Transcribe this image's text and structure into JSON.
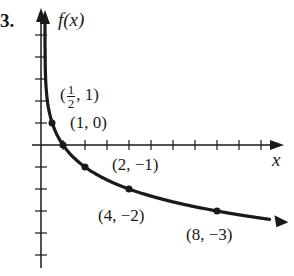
{
  "problem_number": "3.",
  "chart_data": {
    "type": "line",
    "title": "",
    "function": "f(x) = -log2(x)",
    "xlabel": "x",
    "ylabel": "f(x)",
    "xlim": [
      -0.5,
      11
    ],
    "ylim": [
      -5.5,
      5.5
    ],
    "grid": false,
    "ticks": {
      "x_spacing": 1,
      "y_spacing": 1
    },
    "points": [
      {
        "x": 0.5,
        "y": 1,
        "label": "(1/2, 1)"
      },
      {
        "x": 1,
        "y": 0,
        "label": "(1, 0)"
      },
      {
        "x": 2,
        "y": -1,
        "label": "(2, −1)"
      },
      {
        "x": 4,
        "y": -2,
        "label": "(4, −2)"
      },
      {
        "x": 8,
        "y": -3,
        "label": "(8, −3)"
      }
    ]
  },
  "labels": {
    "y_axis": "f(x)",
    "x_axis": "x",
    "p_half_open": "(",
    "p_half_num": "1",
    "p_half_den": "2",
    "p_half_close": ", 1)",
    "p1": "(1, 0)",
    "p2": "(2, −1)",
    "p4": "(4, −2)",
    "p8": "(8, −3)"
  }
}
